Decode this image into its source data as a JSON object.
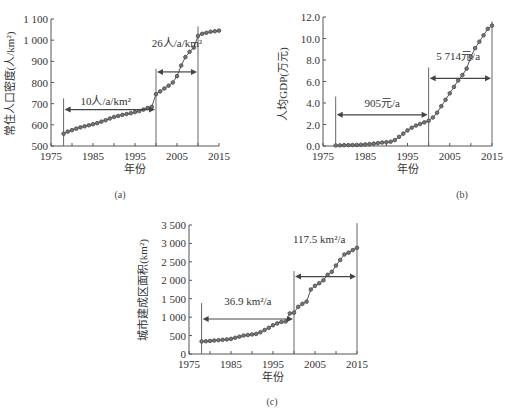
{
  "chart_data": [
    {
      "id": "a",
      "type": "line",
      "caption": "(a)",
      "title": "",
      "xlabel": "年份",
      "ylabel": "常住人口密度(人/km²)",
      "xlim": [
        1975,
        2015
      ],
      "ylim": [
        500,
        1100
      ],
      "xticks": [
        1975,
        1985,
        1995,
        2005,
        2015
      ],
      "xtick_labels": [
        "1975",
        "1985",
        "1995",
        "2005",
        "2015"
      ],
      "yticks": [
        500,
        600,
        700,
        800,
        900,
        1000,
        1100
      ],
      "ytick_labels": [
        "500",
        "600",
        "700",
        "800",
        "900",
        "1 000",
        "1 100"
      ],
      "grid": false,
      "x": [
        1978,
        1979,
        1980,
        1981,
        1982,
        1983,
        1984,
        1985,
        1986,
        1987,
        1988,
        1989,
        1990,
        1991,
        1992,
        1993,
        1994,
        1995,
        1996,
        1997,
        1998,
        1999,
        2000,
        2001,
        2002,
        2003,
        2004,
        2005,
        2006,
        2007,
        2008,
        2009,
        2010,
        2011,
        2012,
        2013,
        2014,
        2015
      ],
      "series": [
        {
          "name": "常住人口密度",
          "values": [
            558,
            568,
            575,
            582,
            588,
            593,
            598,
            603,
            608,
            615,
            622,
            630,
            637,
            642,
            647,
            651,
            655,
            660,
            665,
            672,
            680,
            685,
            745,
            758,
            772,
            785,
            800,
            830,
            880,
            920,
            945,
            965,
            1020,
            1030,
            1035,
            1040,
            1042,
            1045
          ]
        }
      ],
      "vlines": [
        {
          "x": 1978,
          "y_top": 725
        },
        {
          "x": 2000,
          "y_top": 865
        },
        {
          "x": 2010,
          "y_top": 1065
        }
      ],
      "annotations": [
        {
          "text": "10人/a/km²",
          "x": 1988,
          "y": 695,
          "arrow_from": 1978,
          "arrow_to": 2000,
          "arrow_y": 672
        },
        {
          "text": "26人/a/km²",
          "x": 2005,
          "y": 970,
          "arrow_from": 2000,
          "arrow_to": 2010,
          "arrow_y": 850
        }
      ]
    },
    {
      "id": "b",
      "type": "line",
      "caption": "(b)",
      "title": "",
      "xlabel": "年份",
      "ylabel": "人均GDP(万元)",
      "xlim": [
        1975,
        2015
      ],
      "ylim": [
        0,
        12
      ],
      "xticks": [
        1975,
        1985,
        1995,
        2005,
        2015
      ],
      "xtick_labels": [
        "1975",
        "1985",
        "1995",
        "2005",
        "2015"
      ],
      "yticks": [
        0,
        2,
        4,
        6,
        8,
        10,
        12
      ],
      "ytick_labels": [
        "0.0",
        "2.0",
        "4.0",
        "6.0",
        "8.0",
        "10.0",
        "12.0"
      ],
      "grid": false,
      "x": [
        1978,
        1979,
        1980,
        1981,
        1982,
        1983,
        1984,
        1985,
        1986,
        1987,
        1988,
        1989,
        1990,
        1991,
        1992,
        1993,
        1994,
        1995,
        1996,
        1997,
        1998,
        1999,
        2000,
        2001,
        2002,
        2003,
        2004,
        2005,
        2006,
        2007,
        2008,
        2009,
        2010,
        2011,
        2012,
        2013,
        2014,
        2015
      ],
      "series": [
        {
          "name": "人均GDP",
          "values": [
            0.05,
            0.06,
            0.07,
            0.08,
            0.09,
            0.1,
            0.12,
            0.15,
            0.18,
            0.22,
            0.27,
            0.32,
            0.35,
            0.4,
            0.55,
            0.85,
            1.15,
            1.45,
            1.7,
            1.9,
            2.05,
            2.2,
            2.35,
            2.65,
            3.1,
            3.7,
            4.3,
            4.9,
            5.5,
            6.1,
            6.6,
            7.2,
            8.3,
            9.1,
            9.7,
            10.3,
            10.9,
            11.2
          ]
        }
      ],
      "vlines": [
        {
          "x": 1978,
          "y_top": 4.6
        },
        {
          "x": 2000,
          "y_top": 7.3
        },
        {
          "x": 2015,
          "y_top": 11.6
        }
      ],
      "annotations": [
        {
          "text": "905元/a",
          "x": 1989,
          "y": 3.6,
          "arrow_from": 1978,
          "arrow_to": 2000,
          "arrow_y": 2.9
        },
        {
          "text": "5 714元/a",
          "x": 2007,
          "y": 8.0,
          "arrow_from": 2000,
          "arrow_to": 2015,
          "arrow_y": 6.3
        }
      ]
    },
    {
      "id": "c",
      "type": "line",
      "caption": "(c)",
      "title": "",
      "xlabel": "年份",
      "ylabel": "城市建成区面积(km²)",
      "xlim": [
        1975,
        2015
      ],
      "ylim": [
        0,
        3500
      ],
      "xticks": [
        1975,
        1985,
        1995,
        2005,
        2015
      ],
      "xtick_labels": [
        "1975",
        "1985",
        "1995",
        "2005",
        "2015"
      ],
      "yticks": [
        0,
        500,
        1000,
        1500,
        2000,
        2500,
        3000,
        3500
      ],
      "ytick_labels": [
        "0",
        "500",
        "1 000",
        "1 500",
        "2 000",
        "2 500",
        "3 000",
        "3 500"
      ],
      "grid": false,
      "x": [
        1978,
        1979,
        1980,
        1981,
        1982,
        1983,
        1984,
        1985,
        1986,
        1987,
        1988,
        1989,
        1990,
        1991,
        1992,
        1993,
        1994,
        1995,
        1996,
        1997,
        1998,
        1999,
        2000,
        2001,
        2002,
        2003,
        2004,
        2005,
        2006,
        2007,
        2008,
        2009,
        2010,
        2011,
        2012,
        2013,
        2014,
        2015
      ],
      "series": [
        {
          "name": "城市建成区面积",
          "values": [
            340,
            345,
            355,
            365,
            375,
            385,
            395,
            410,
            440,
            470,
            500,
            515,
            530,
            545,
            590,
            650,
            710,
            780,
            830,
            870,
            880,
            1100,
            1120,
            1280,
            1360,
            1420,
            1750,
            1850,
            1920,
            2000,
            2150,
            2230,
            2400,
            2550,
            2700,
            2750,
            2820,
            2880
          ]
        }
      ],
      "vlines": [
        {
          "x": 1978,
          "y_top": 1380
        },
        {
          "x": 2000,
          "y_top": 2250
        },
        {
          "x": 2015,
          "y_top": 3550
        }
      ],
      "annotations": [
        {
          "text": "36.9 km²/a",
          "x": 1989,
          "y": 1320,
          "arrow_from": 1978,
          "arrow_to": 2000,
          "arrow_y": 950
        },
        {
          "text": "117.5 km²/a",
          "x": 2006,
          "y": 3020,
          "arrow_from": 2000,
          "arrow_to": 2015,
          "arrow_y": 2100
        }
      ]
    }
  ]
}
